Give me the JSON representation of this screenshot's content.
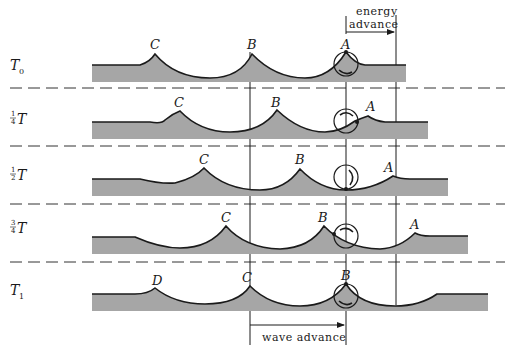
{
  "annotations": {
    "energy_advance_line1": "energy",
    "energy_advance_line2": "advance",
    "wave_advance": "wave advance"
  },
  "rows": [
    {
      "id": "t0",
      "label_main": "T",
      "label_sub": "0",
      "crests": [
        "C",
        "B",
        "A"
      ]
    },
    {
      "id": "t1q",
      "label_frac_num": "1",
      "label_frac_den": "4",
      "label_main": "T",
      "crests": [
        "C",
        "B",
        "A"
      ]
    },
    {
      "id": "t1h",
      "label_frac_num": "1",
      "label_frac_den": "2",
      "label_main": "T",
      "crests": [
        "C",
        "B",
        "A"
      ]
    },
    {
      "id": "t3q",
      "label_frac_num": "3",
      "label_frac_den": "4",
      "label_main": "T",
      "crests": [
        "C",
        "B",
        "A"
      ]
    },
    {
      "id": "t1",
      "label_main": "T",
      "label_sub": "1",
      "crests": [
        "D",
        "C",
        "B",
        "B"
      ]
    }
  ],
  "colors": {
    "water": "#a6a6a6",
    "line": "#1a1a1a",
    "background": "#ffffff"
  }
}
